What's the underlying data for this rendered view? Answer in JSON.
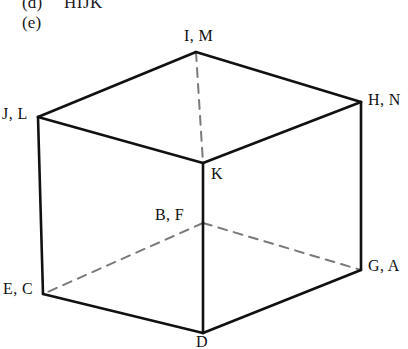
{
  "figure": {
    "background_color": "#ffffff",
    "ink_color": "#111111",
    "caption_items": [
      {
        "tag": "(d)",
        "text": "HIJK"
      },
      {
        "tag": "(e)",
        "text": ""
      }
    ],
    "shape": {
      "name": "cube",
      "projection": "isometric",
      "solid_color": "#111111",
      "hidden_color": "#7a7a7a",
      "solid_stroke_width": 2.6,
      "hidden_stroke_width": 2.0,
      "hidden_dash_pattern": "9 7"
    },
    "vertices": [
      {
        "id": "top-apex",
        "label": "I, M",
        "x": 196,
        "y": 52,
        "hidden": false
      },
      {
        "id": "upper-left",
        "label": "J, L",
        "x": 38,
        "y": 117,
        "hidden": false
      },
      {
        "id": "upper-right",
        "label": "H, N",
        "x": 361,
        "y": 102,
        "hidden": false
      },
      {
        "id": "center-upper",
        "label": "K",
        "x": 203,
        "y": 163,
        "hidden": false
      },
      {
        "id": "center-lower",
        "label": "B, F",
        "x": 203,
        "y": 223,
        "hidden": false
      },
      {
        "id": "lower-left",
        "label": "E, C",
        "x": 43,
        "y": 294,
        "hidden": false
      },
      {
        "id": "lower-right",
        "label": "G, A",
        "x": 361,
        "y": 270,
        "hidden": false
      },
      {
        "id": "bottom-apex",
        "label": "D",
        "x": 203,
        "y": 333,
        "hidden": false
      }
    ],
    "edges_solid": [
      {
        "from": "top-apex",
        "to": "upper-left"
      },
      {
        "from": "top-apex",
        "to": "upper-right"
      },
      {
        "from": "upper-left",
        "to": "center-upper"
      },
      {
        "from": "upper-right",
        "to": "center-upper"
      },
      {
        "from": "upper-left",
        "to": "lower-left"
      },
      {
        "from": "upper-right",
        "to": "lower-right"
      },
      {
        "from": "center-upper",
        "to": "center-lower"
      },
      {
        "from": "center-lower",
        "to": "bottom-apex"
      },
      {
        "from": "lower-left",
        "to": "bottom-apex"
      },
      {
        "from": "lower-right",
        "to": "bottom-apex"
      }
    ],
    "edges_hidden": [
      {
        "from": "top-apex",
        "to": "center-upper"
      },
      {
        "from": "center-lower",
        "to": "lower-left"
      },
      {
        "from": "center-lower",
        "to": "lower-right"
      }
    ]
  }
}
